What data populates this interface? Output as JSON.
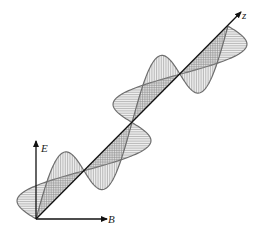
{
  "figure": {
    "axes": {
      "e_label": "E",
      "b_label": "B",
      "z_label": "z"
    },
    "waves": {
      "wavelengths_shown": 2,
      "electric_field": {
        "name": "E",
        "orientation": "vertical",
        "phase": "sin",
        "hatch": "vertical"
      },
      "magnetic_field": {
        "name": "B",
        "orientation": "horizontal",
        "phase": "-sin",
        "hatch": "horizontal"
      }
    },
    "colors": {
      "axis": "#111111",
      "wave": "#6e6e6e",
      "hatch": "#8a8a8a"
    }
  }
}
